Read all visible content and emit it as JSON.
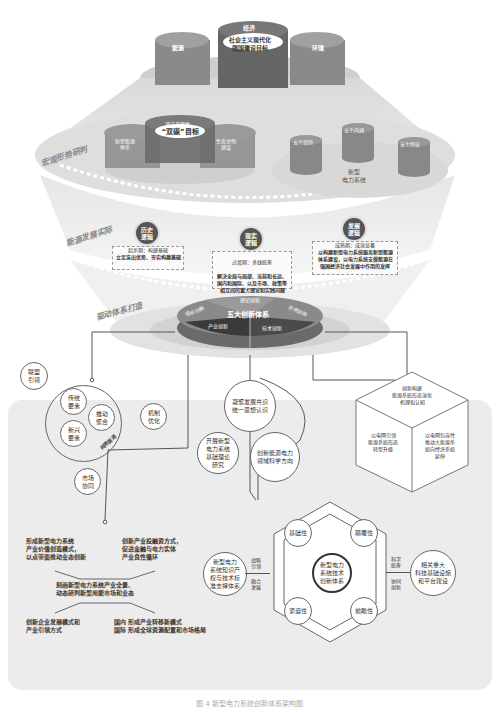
{
  "top": {
    "economy": "经济",
    "goal": "社会主义现代化\n强国建设目标",
    "energy": "能源",
    "environment": "环境"
  },
  "layer1": {
    "side_label": "宏观形势研判",
    "dual_carbon": {
      "center": "“双碳”目标",
      "top": "清洁美丽性",
      "left": "新型能源\n体系",
      "right": "生态文明\n建设"
    },
    "new_power": {
      "title": "新型\n电力系统",
      "c1": "五个坚持",
      "c2": "五个内涵",
      "c3": "五个特征"
    }
  },
  "layer2": {
    "side_label": "能源发展实际",
    "history": {
      "title": "历史\n逻辑",
      "sub": "起步期：构建基础",
      "desc": "立足突出优势、夯实构建基础"
    },
    "reality": {
      "title": "现实\n逻辑",
      "sub": "过渡期：多线统筹",
      "desc": "解决全局与局部、当前和长远、\n国内和国际、以及市场、政策等\n相互间的重大理论和实践问题"
    },
    "development": {
      "title": "发展\n逻辑",
      "sub": "成熟期：成效显著",
      "desc": "以构建新型电力系统服务新型能源\n体系建设，以电力系统支撑能源在\n强国经济社会发展中作用的发挥"
    }
  },
  "layer3": {
    "side_label": "驱动体系打造",
    "center": "五大创新体系",
    "segments": [
      "理论创新",
      "组织创新",
      "形态创新",
      "产业创新",
      "技术创新"
    ]
  },
  "org_innovation": {
    "alliance": "联盟\n引领",
    "traditional": "传统\n要素",
    "emerging": "新兴\n要素",
    "aggregate": "推动\n聚合",
    "mechanism": "机制\n优化",
    "market": "市场\n协同",
    "arc_label": "共同促进"
  },
  "theory_innovation": {
    "c1": "凝聚发展共识\n统一思想认识",
    "c2": "开展新型\n电力系统\n基础理论\n研究",
    "c3": "创新能源电力\n领域科学方向"
  },
  "form_innovation": {
    "top": "创新构建\n能源系统形态演化\n机理和认知",
    "left": "以电网引领\n能源系统形态\n转型升级",
    "right": "以电网包容性\n推动大能源系\n统向经济系统\n延伸"
  },
  "industry_innovation": {
    "tl": "形成新型电力系统\n产业价值创造模式，\n以点带面推动业态创新",
    "tr": "创新产业投融资方式，\n促进金融与电力实体\n产业良性循环",
    "center": "刻画新型电力系统产业全景、\n动态研判新型用能市场和业态",
    "bl": "创新企业发展模式和\n产业引领方式",
    "br_domestic_label": "国内",
    "br_domestic": "形成产业转移新模式",
    "br_intl_label": "国际",
    "br_intl": "形成全球资源配置和市场格局"
  },
  "tech_innovation": {
    "left_circle": "新型电力\n系统知识产\n权与技术标\n准支撑体系",
    "left_link_top": "战略\n引领",
    "left_link_bottom": "融合\n发展",
    "center": "新型电力\n系统技术\n创新体系",
    "n1": "基础性",
    "n2": "颠覆性",
    "n3": "紧迫性",
    "n4": "前瞻性",
    "right_link_top": "科学\n统筹",
    "right_link_bottom": "协同\n创新",
    "right_circle": "相关重大\n科技基础设施\n和平台建设"
  },
  "caption": "图 4  新型电力系统创新体系架构图",
  "colors": {
    "dark": "#555555",
    "mid": "#777777",
    "light": "#cccccc",
    "panel": "#ececec"
  }
}
